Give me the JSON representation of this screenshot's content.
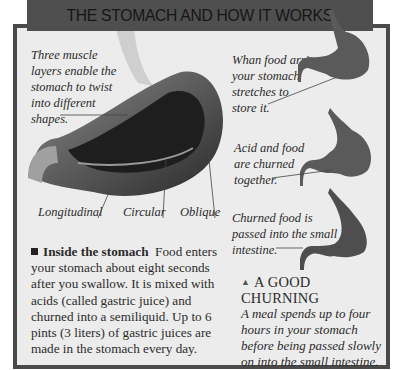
{
  "header": {
    "title": "THE STOMACH AND HOW IT WORKS"
  },
  "main_illustration": {
    "caption": [
      "Three muscle",
      "layers enable the",
      "stomach to twist",
      "into different",
      "shapes."
    ],
    "labels": [
      "Longitudinal",
      "Circular",
      "Oblique"
    ]
  },
  "stages": [
    {
      "caption": [
        "Whan food arrives",
        "your stomach",
        "stretches to",
        "store it."
      ]
    },
    {
      "caption": [
        "Acid and food",
        "are churned",
        "together."
      ]
    },
    {
      "caption": [
        "Churned food is",
        "passed into the small",
        "intestine."
      ]
    }
  ],
  "inside": {
    "heading": "Inside the stomach",
    "text": "Food enters your stomach about eight seconds after you swallow. It is mixed with acids (called gastric juice) and churned into a semiliquid. Up to 6 pints (3 liters) of gastric juices are made in the stomach every day."
  },
  "churning": {
    "icon": "triangle-up-icon",
    "title": "A GOOD CHURNING",
    "text": "A meal spends up to four hours in your stomach before being passed slowly on into the small intestine."
  },
  "colors": {
    "header_bg": "#4f4f4f",
    "frame_border": "#4a4a4a",
    "panel_bg": "#ececec"
  }
}
